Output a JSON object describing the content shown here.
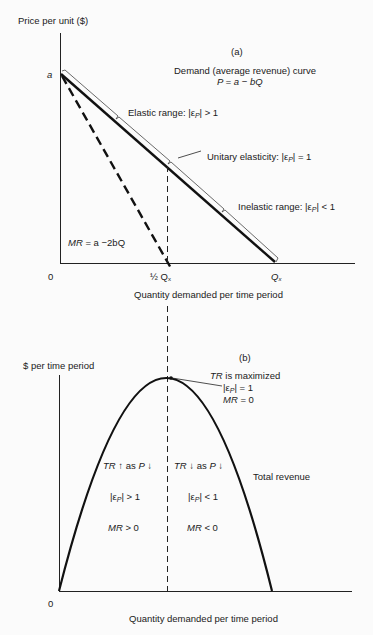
{
  "panel_a": {
    "label": "(a)",
    "y_axis_label": "Price per unit ($)",
    "x_axis_label": "Quantity demanded per time period",
    "origin_label": "0",
    "intercept_label": "a",
    "half_q_label": "½ Q",
    "half_q_sub": "x",
    "qx_label": "Q",
    "qx_sub": "x",
    "demand_title": "Demand (average revenue) curve",
    "demand_equation": "P = a − bQ",
    "elastic_label": "Elastic range: |ε",
    "elastic_sub": "P",
    "elastic_tail": "| > 1",
    "unitary_label": "Unitary elasticity: |ε",
    "unitary_sub": "P",
    "unitary_tail": "| = 1",
    "inelastic_label": "Inelastic range: |ε",
    "inelastic_sub": "P",
    "inelastic_tail": "| < 1",
    "mr_label": "MR",
    "mr_equation": " = a −2bQ"
  },
  "panel_b": {
    "label": "(b)",
    "y_axis_label": "$ per time period",
    "x_axis_label": "Quantity demanded per time period",
    "origin_label": "0",
    "max_line1_italic": "TR",
    "max_line1": " is maximized",
    "max_line2": "|ε",
    "max_line2_sub": "P",
    "max_line2_tail": "| = 1",
    "max_line3_italic": "MR",
    "max_line3": " = 0",
    "curve_label": "Total revenue",
    "left_region": {
      "line1_tr": "TR",
      "line1_mid": " ↑ as ",
      "line1_p": "P",
      "line1_tail": " ↓",
      "line2": "|ε",
      "line2_sub": "P",
      "line2_tail": "| > 1",
      "line3_mr": "MR",
      "line3_tail": " > 0"
    },
    "right_region": {
      "line1_tr": "TR",
      "line1_mid": " ↓ as ",
      "line1_p": "P",
      "line1_tail": " ↓",
      "line2": "|ε",
      "line2_sub": "P",
      "line2_tail": "| < 1",
      "line3_mr": "MR",
      "line3_tail": " < 0"
    }
  }
}
